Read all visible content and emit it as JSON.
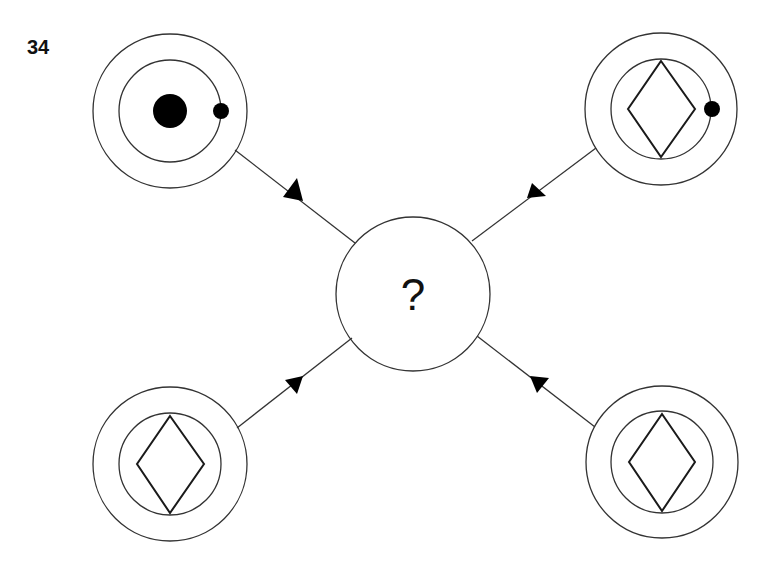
{
  "question_number": "34",
  "center_node": {
    "text": "?"
  },
  "colors": {
    "stroke": "#333333",
    "fill_dot": "#000000",
    "background": "#ffffff"
  },
  "nodes": [
    {
      "position": "top-left",
      "inner_shape": "large-filled-dot",
      "has_small_dot_on_inner_ring": true,
      "arrow_direction": "toward-center"
    },
    {
      "position": "top-right",
      "inner_shape": "diamond",
      "has_small_dot_on_inner_ring": true,
      "arrow_direction": "toward-center"
    },
    {
      "position": "bottom-left",
      "inner_shape": "diamond",
      "has_small_dot_on_inner_ring": false,
      "arrow_direction": "toward-center"
    },
    {
      "position": "bottom-right",
      "inner_shape": "diamond",
      "has_small_dot_on_inner_ring": false,
      "arrow_direction": "toward-center"
    }
  ]
}
